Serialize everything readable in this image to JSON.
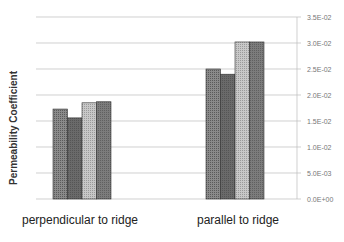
{
  "chart_data": {
    "type": "bar",
    "title": "",
    "xlabel": "",
    "ylabel": "Permeability Coefficient",
    "ylim": [
      0,
      0.035
    ],
    "yticks": [
      "0.0E+00",
      "5.0E-03",
      "1.0E-02",
      "1.5E-02",
      "2.0E-02",
      "2.5E-02",
      "3.0E-02",
      "3.5E-02"
    ],
    "y_axis_position": "right",
    "grid": true,
    "legend": "none",
    "categories": [
      "perpendicular to ridge",
      "parallel to ridge"
    ],
    "series": [
      {
        "name": "Series 1",
        "values": [
          0.0173,
          0.025
        ],
        "color": "#7a7a7a"
      },
      {
        "name": "Series 2",
        "values": [
          0.0156,
          0.024
        ],
        "color": "#666666"
      },
      {
        "name": "Series 3",
        "values": [
          0.0185,
          0.0302
        ],
        "color": "#b8b8b8"
      },
      {
        "name": "Series 4",
        "values": [
          0.0187,
          0.0302
        ],
        "color": "#707070"
      }
    ]
  }
}
